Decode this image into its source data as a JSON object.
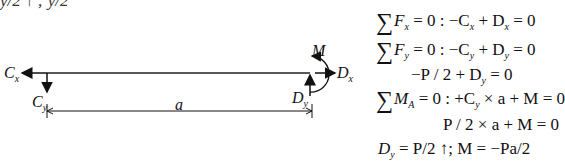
{
  "top_fragment": "y/2 ↑ ; y/2",
  "diagram": {
    "labels": {
      "cx": "C",
      "cx_sub": "x",
      "cy": "C",
      "cy_sub": "y",
      "dx": "D",
      "dx_sub": "x",
      "dy": "D",
      "dy_sub": "y",
      "moment": "M",
      "length": "a"
    }
  },
  "equations": [
    {
      "sigma": "∑",
      "text": "F",
      "sub": "x",
      "rest": " = 0 : −C",
      "sub2": "x",
      "rest2": " + D",
      "sub3": "x",
      "rest3": " = 0"
    },
    {
      "sigma": "∑",
      "text": "F",
      "sub": "y",
      "rest": " = 0 : −C",
      "sub2": "y",
      "rest2": " + D",
      "sub3": "y",
      "rest3": " = 0"
    },
    {
      "text": "−P / 2 + D",
      "sub": "y",
      "rest": " = 0"
    },
    {
      "sigma": "∑",
      "text": "M",
      "sub": "A",
      "rest": " = 0 :  +C",
      "sub2": "y",
      "rest2": " × a + M = 0"
    },
    {
      "text": "P / 2 × a + M = 0"
    },
    {
      "text": "D",
      "sub": "y",
      "rest": " = P/2 ↑; M = −Pa/2"
    }
  ]
}
